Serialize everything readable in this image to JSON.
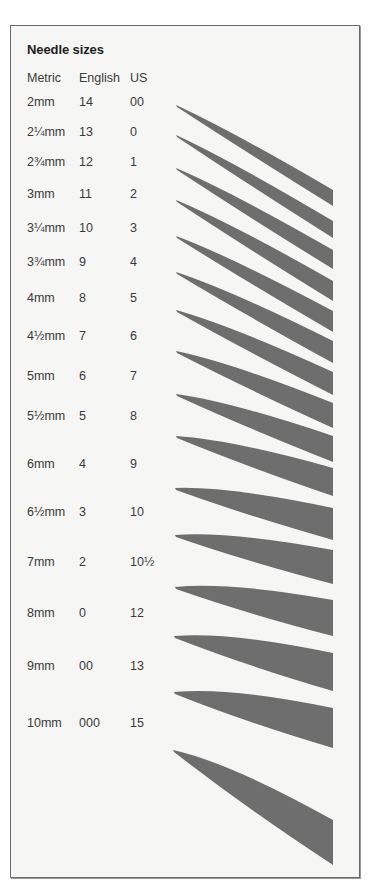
{
  "title": "Needle sizes",
  "columns": [
    "Metric",
    "English",
    "US"
  ],
  "rows": [
    {
      "metric": "2mm",
      "english": "14",
      "us": "00"
    },
    {
      "metric": "2¼mm",
      "english": "13",
      "us": "0"
    },
    {
      "metric": "2¾mm",
      "english": "12",
      "us": "1"
    },
    {
      "metric": "3mm",
      "english": "11",
      "us": "2"
    },
    {
      "metric": "3¼mm",
      "english": "10",
      "us": "3"
    },
    {
      "metric": "3¾mm",
      "english": "9",
      "us": "4"
    },
    {
      "metric": "4mm",
      "english": "8",
      "us": "5"
    },
    {
      "metric": "4½mm",
      "english": "7",
      "us": "6"
    },
    {
      "metric": "5mm",
      "english": "6",
      "us": "7"
    },
    {
      "metric": "5½mm",
      "english": "5",
      "us": "8"
    },
    {
      "metric": "6mm",
      "english": "4",
      "us": "9"
    },
    {
      "metric": "6½mm",
      "english": "3",
      "us": "10"
    },
    {
      "metric": "7mm",
      "english": "2",
      "us": "10½"
    },
    {
      "metric": "8mm",
      "english": "0",
      "us": "12"
    },
    {
      "metric": "9mm",
      "english": "00",
      "us": "13"
    },
    {
      "metric": "10mm",
      "english": "000",
      "us": "15"
    }
  ],
  "colors": {
    "needle": "#6e6e6e",
    "background": "#f6f6f4",
    "border": "#6a6a6a",
    "text": "#3a3a3a"
  }
}
